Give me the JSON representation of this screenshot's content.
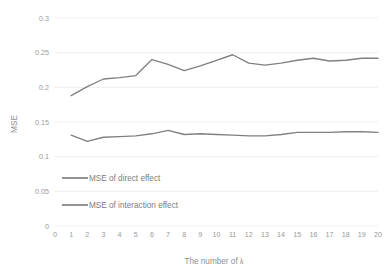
{
  "chart_data": {
    "type": "line",
    "title": "",
    "xlabel": "The number of k",
    "xlabel_plain": "The number of ",
    "xlabel_italic": "k",
    "ylabel": "MSE",
    "x": [
      0,
      1,
      2,
      3,
      4,
      5,
      6,
      7,
      8,
      9,
      10,
      11,
      12,
      13,
      14,
      15,
      16,
      17,
      18,
      19,
      20
    ],
    "xtick_labels": [
      "0",
      "1",
      "2",
      "3",
      "4",
      "5",
      "6",
      "7",
      "8",
      "9",
      "10",
      "11",
      "12",
      "13",
      "14",
      "15",
      "16",
      "17",
      "18",
      "19",
      "20"
    ],
    "ytick_labels": [
      "0",
      "0.05",
      "0.1",
      "0.15",
      "0.2",
      "0.25",
      "0.3"
    ],
    "ytick_values": [
      0,
      0.05,
      0.1,
      0.15,
      0.2,
      0.25,
      0.3
    ],
    "ylim": [
      0,
      0.3
    ],
    "xlim": [
      0,
      20
    ],
    "grid": "horizontal",
    "legend_position": "inside-lower-left",
    "series": [
      {
        "name": "MSE of direct effect",
        "color": "#808080",
        "x": [
          1,
          2,
          3,
          4,
          5,
          6,
          7,
          8,
          9,
          10,
          11,
          12,
          13,
          14,
          15,
          16,
          17,
          18,
          19,
          20
        ],
        "values": [
          0.188,
          0.201,
          0.212,
          0.214,
          0.217,
          0.24,
          0.233,
          0.224,
          0.231,
          0.239,
          0.247,
          0.235,
          0.232,
          0.235,
          0.239,
          0.242,
          0.238,
          0.239,
          0.242,
          0.242
        ]
      },
      {
        "name": "MSE of interaction effect",
        "color": "#808080",
        "x": [
          1,
          2,
          3,
          4,
          5,
          6,
          7,
          8,
          9,
          10,
          11,
          12,
          13,
          14,
          15,
          16,
          17,
          18,
          19,
          20
        ],
        "values": [
          0.131,
          0.122,
          0.128,
          0.129,
          0.13,
          0.133,
          0.138,
          0.132,
          0.133,
          0.132,
          0.131,
          0.13,
          0.13,
          0.132,
          0.135,
          0.135,
          0.135,
          0.136,
          0.136,
          0.135
        ]
      }
    ]
  },
  "legend": {
    "items": [
      {
        "label": "MSE of direct effect"
      },
      {
        "label": "MSE of interaction effect"
      }
    ]
  },
  "colors": {
    "line": "#808080",
    "gridline": "#e8e8e8",
    "text": "#8f8f8f",
    "background": "#ffffff"
  }
}
